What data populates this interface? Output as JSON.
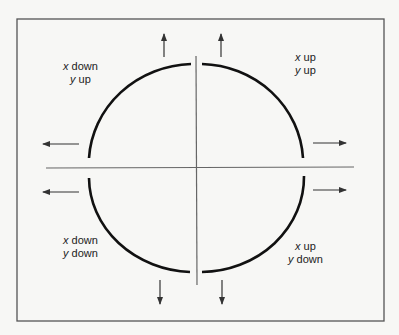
{
  "diagram": {
    "title": "",
    "colors": {
      "background": "#f7f7f5",
      "frame": "#555555",
      "axis": "#666666",
      "arc": "#111111",
      "arrow": "#333333",
      "text": "#222222"
    },
    "quadrants": {
      "top_left": {
        "line1_var": "x",
        "line1_dir": " down",
        "line2_var": "y",
        "line2_dir": " up"
      },
      "top_right": {
        "line1_var": "x",
        "line1_dir": " up",
        "line2_var": "y",
        "line2_dir": " up"
      },
      "bottom_left": {
        "line1_var": "x",
        "line1_dir": " down",
        "line2_var": "y",
        "line2_dir": " down"
      },
      "bottom_right": {
        "line1_var": "x",
        "line1_dir": " up",
        "line2_var": "y",
        "line2_dir": " down"
      }
    },
    "arrows": [
      {
        "name": "arrow-up-left",
        "direction": "up"
      },
      {
        "name": "arrow-up-right",
        "direction": "up"
      },
      {
        "name": "arrow-left-upper",
        "direction": "left"
      },
      {
        "name": "arrow-left-lower",
        "direction": "left"
      },
      {
        "name": "arrow-right-upper",
        "direction": "right"
      },
      {
        "name": "arrow-right-lower",
        "direction": "right"
      },
      {
        "name": "arrow-down-left",
        "direction": "down"
      },
      {
        "name": "arrow-down-right",
        "direction": "down"
      }
    ]
  }
}
